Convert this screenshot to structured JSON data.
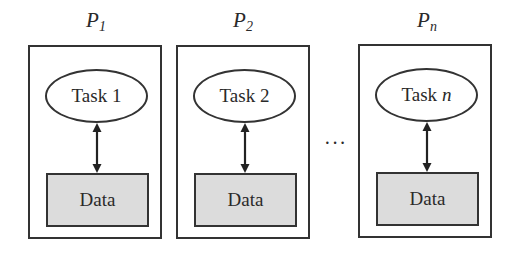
{
  "processors": [
    {
      "label": "P",
      "sub": "1",
      "task": "Task",
      "task_num": "1",
      "task_num_italic": false,
      "data": "Data"
    },
    {
      "label": "P",
      "sub": "2",
      "task": "Task",
      "task_num": "2",
      "task_num_italic": false,
      "data": "Data"
    },
    {
      "label": "P",
      "sub": "n",
      "task": "Task",
      "task_num": "n",
      "task_num_italic": true,
      "data": "Data"
    }
  ],
  "ellipsis": "···",
  "colors": {
    "border": "#333333",
    "data_fill": "#dcdcdc",
    "background": "#ffffff"
  }
}
